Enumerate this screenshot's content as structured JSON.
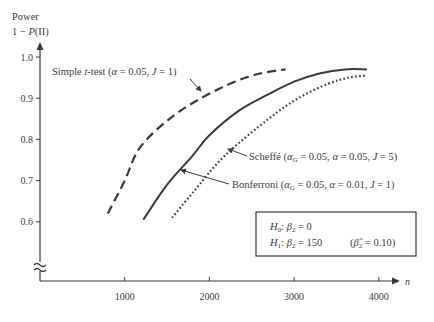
{
  "chart_data": {
    "type": "line",
    "title": "",
    "xlabel": "n",
    "ylabel": "Power 1 − P(II)",
    "ylabel_lines": [
      "Power",
      "1 − P(II)"
    ],
    "xlim": [
      0,
      4300
    ],
    "ylim": [
      0.5,
      1.0
    ],
    "x_ticks": [
      1000,
      2000,
      3000,
      4000
    ],
    "x_tick_labels": [
      "1000",
      "2000",
      "3000",
      "4000"
    ],
    "y_ticks": [
      0.6,
      0.7,
      0.8,
      0.9,
      1.0
    ],
    "y_tick_labels": [
      "0.6",
      "0.7",
      "0.8",
      "0.9",
      "1.0"
    ],
    "axis_break": "y",
    "grid": false,
    "legend": "none (inline annotations)",
    "series": [
      {
        "name": "Simple t-test (α = 0.05, J = 1)",
        "style": "dashed",
        "x": [
          800,
          1000,
          1180,
          1530,
          1900,
          2300,
          2600,
          2900
        ],
        "y": [
          0.62,
          0.7,
          0.78,
          0.85,
          0.9,
          0.94,
          0.96,
          0.97
        ]
      },
      {
        "name": "Bonferroni (α_G = 0.05, α = 0.01, J = 1)",
        "style": "solid",
        "x": [
          1220,
          1500,
          1800,
          2000,
          2350,
          2700,
          3000,
          3300,
          3600,
          3860
        ],
        "y": [
          0.605,
          0.69,
          0.76,
          0.81,
          0.87,
          0.91,
          0.94,
          0.96,
          0.97,
          0.97
        ]
      },
      {
        "name": "Scheffé (α_G = 0.05, α = 0.05, J = 5)",
        "style": "dotted",
        "x": [
          1560,
          1800,
          2180,
          2700,
          3050,
          3400,
          3650,
          3860
        ],
        "y": [
          0.61,
          0.67,
          0.76,
          0.85,
          0.9,
          0.935,
          0.95,
          0.955
        ]
      }
    ],
    "annotations": [
      {
        "text": "Simple t-test (α = 0.05, J = 1)",
        "points_to": "dashed curve"
      },
      {
        "text": "Scheffé (α_G = 0.05, α = 0.05, J = 5)",
        "points_to": "dotted curve"
      },
      {
        "text": "Bonferroni (α_G = 0.05, α = 0.01, J = 1)",
        "points_to": "solid curve"
      }
    ],
    "hypothesis_box": {
      "line1": "H0: β2 = 0",
      "line2": "H1: β2 = 150",
      "line2_note": "(β̃2 = 0.10)"
    }
  },
  "labels": {
    "y_title_1": "Power",
    "y_title_2_prefix": "1 − ",
    "y_title_2_p": "P",
    "y_title_2_suffix": "(II)",
    "x_axis": "n",
    "ttest_prefix": "Simple ",
    "ttest_t": "t",
    "ttest_rest": "-test (",
    "ttest_alpha": "α",
    "ttest_vals": " = 0.05,  ",
    "ttest_J": "J",
    "ttest_end": " = 1)",
    "scheffe_name": "Scheffé (",
    "scheffe_alpha": "α",
    "scheffe_G": "G",
    "scheffe_v1": " = 0.05, ",
    "scheffe_alpha2": "α",
    "scheffe_v2": " = 0.05,  ",
    "scheffe_J": "J",
    "scheffe_end": " = 5)",
    "bonf_name": "Bonferroni (",
    "bonf_alpha": "α",
    "bonf_G": "G",
    "bonf_v1": " = 0.05, ",
    "bonf_alpha2": "α",
    "bonf_v2": " = 0.01,  ",
    "bonf_J": "J",
    "bonf_end": " = 1)",
    "h0_H": "H",
    "h0_sub": "0",
    "h0_rest": ": ",
    "h0_beta": "β",
    "h0_bsub": "2",
    "h0_val": " = 0",
    "h1_H": "H",
    "h1_sub": "1",
    "h1_rest": ": ",
    "h1_beta": "β",
    "h1_bsub": "2",
    "h1_val": " = 150",
    "h1_note_open": "(",
    "h1_note_beta": "β̃",
    "h1_note_bsub": "2",
    "h1_note_val": " = 0.10)"
  },
  "colors": {
    "ink": "#3a3a3a",
    "background": "#ffffff"
  }
}
